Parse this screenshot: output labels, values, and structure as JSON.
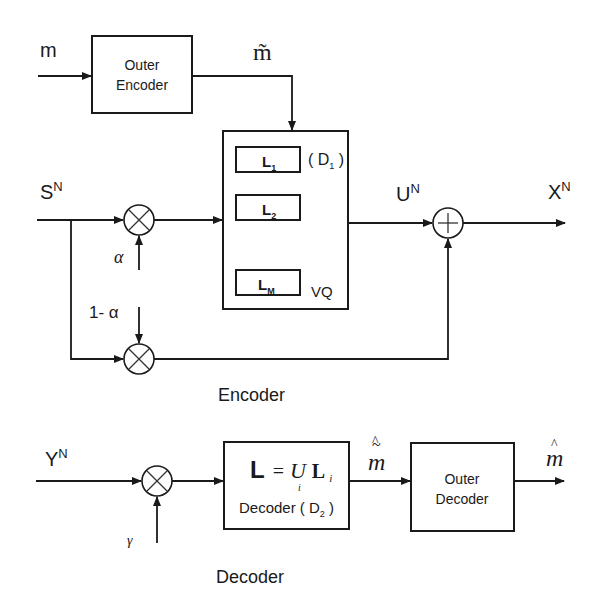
{
  "diagram": {
    "type": "block-diagram",
    "encoder": {
      "section_label": "Encoder",
      "input_message": "m",
      "outer_encoder": {
        "line1": "Outer",
        "line2": "Encoder"
      },
      "encoded_message": "m̃",
      "source": {
        "base": "S",
        "sup": "N"
      },
      "alpha": "α",
      "one_minus_alpha": "1- α",
      "vq": {
        "label": "VQ",
        "distortion": {
          "open": "( D",
          "sub": "1",
          "close": " )"
        },
        "bins": [
          {
            "base": "L",
            "sub": "1"
          },
          {
            "base": "L",
            "sub": "2"
          },
          {
            "base": "L",
            "sub": "M"
          }
        ]
      },
      "codeword": {
        "base": "U",
        "sup": "N"
      },
      "output": {
        "base": "X",
        "sup": "N"
      },
      "multiplier_symbol": "×",
      "adder_symbol": "+"
    },
    "decoder": {
      "section_label": "Decoder",
      "received": {
        "base": "Y",
        "sup": "N"
      },
      "gamma": "γ",
      "inner_decoder": {
        "formula_lhs": "L",
        "formula_eq": "=",
        "formula_union": "U",
        "formula_union_sub": "i",
        "formula_rhs": "L",
        "formula_rhs_sub": "i",
        "label": "Decoder ( D",
        "label_sub": "2",
        "label_close": " )"
      },
      "decoded_inner": "m̃̂",
      "outer_decoder": {
        "line1": "Outer",
        "line2": "Decoder"
      },
      "decoded_message": "m̂"
    }
  }
}
